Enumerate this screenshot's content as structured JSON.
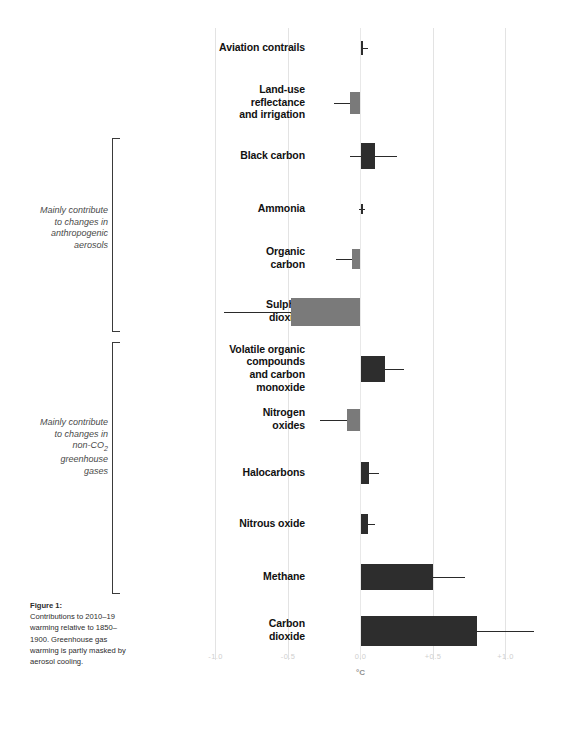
{
  "figure": {
    "caption_title": "Figure 1:",
    "caption_body": "Contributions to 2010–19 warming relative to 1850–1900. Greenhouse gas warming is partly masked by aerosol cooling."
  },
  "axis": {
    "unit_label": "°C",
    "tick_labels": [
      "-1.0",
      "-0.5",
      "0.0",
      "+0.5",
      "+1.0"
    ],
    "tick_values": [
      -1.0,
      -0.5,
      0.0,
      0.5,
      1.0
    ],
    "xmin": -1.15,
    "xmax": 1.45
  },
  "groups": [
    {
      "id": "anthropogenic-aerosols",
      "label_lines": [
        "Mainly contribute",
        "to changes in",
        "anthropogenic",
        "aerosols"
      ],
      "members": [
        "Black carbon",
        "Ammonia",
        "Organic carbon",
        "Sulphur dioxide"
      ]
    },
    {
      "id": "non-co2-greenhouse-gases",
      "label_lines": [
        "Mainly contribute",
        "to changes in",
        "non-CO2",
        "greenhouse",
        "gases"
      ],
      "members": [
        "Volatile organic compounds and carbon monoxide",
        "Nitrogen oxides",
        "Halocarbons",
        "Nitrous oxide",
        "Methane"
      ]
    }
  ],
  "colors": {
    "warming_bar": "#2d2d2d",
    "cooling_bar": "#7a7a7a",
    "gridline": "#e3e3e3",
    "tick_text": "#cfcfcf",
    "label_text": "#111111",
    "bracket_text": "#4a4a4a"
  },
  "chart_data": {
    "type": "bar",
    "orientation": "horizontal",
    "title": "",
    "subtitle": "",
    "xlabel": "°C",
    "ylabel": "",
    "xlim": [
      -1.15,
      1.45
    ],
    "grid": true,
    "legend": "none",
    "categories": [
      "Aviation contrails",
      "Land-use reflectance and irrigation",
      "Black carbon",
      "Ammonia",
      "Organic carbon",
      "Sulphur dioxide",
      "Volatile organic compounds and carbon monoxide",
      "Nitrogen oxides",
      "Halocarbons",
      "Nitrous oxide",
      "Methane",
      "Carbon dioxide"
    ],
    "values": [
      0.02,
      -0.07,
      0.1,
      0.01,
      -0.06,
      -0.48,
      0.17,
      -0.09,
      0.06,
      0.05,
      0.5,
      0.8
    ],
    "error_low": [
      0.0,
      -0.18,
      -0.07,
      -0.01,
      -0.17,
      -0.94,
      0.02,
      -0.28,
      0.02,
      0.02,
      0.02,
      0.02
    ],
    "error_high": [
      0.05,
      0.0,
      0.25,
      0.03,
      0.0,
      -0.02,
      0.3,
      0.0,
      0.13,
      0.1,
      0.72,
      1.2
    ]
  },
  "rows": [
    {
      "name": "aviation-contrails",
      "label_lines": [
        "Aviation contrails"
      ],
      "value": 0.02,
      "lo": 0.0,
      "hi": 0.05,
      "sign": "warming"
    },
    {
      "name": "land-use-reflectance-and-irrigation",
      "label_lines": [
        "Land-use",
        "reflectance",
        "and irrigation"
      ],
      "value": -0.07,
      "lo": -0.18,
      "hi": 0.0,
      "sign": "cooling"
    },
    {
      "name": "black-carbon",
      "label_lines": [
        "Black carbon"
      ],
      "value": 0.1,
      "lo": -0.07,
      "hi": 0.25,
      "sign": "warming"
    },
    {
      "name": "ammonia",
      "label_lines": [
        "Ammonia"
      ],
      "value": 0.01,
      "lo": -0.01,
      "hi": 0.03,
      "sign": "warming"
    },
    {
      "name": "organic-carbon",
      "label_lines": [
        "Organic",
        "carbon"
      ],
      "value": -0.06,
      "lo": -0.17,
      "hi": 0.0,
      "sign": "cooling"
    },
    {
      "name": "sulphur-dioxide",
      "label_lines": [
        "Sulphur",
        "dioxide"
      ],
      "value": -0.48,
      "lo": -0.94,
      "hi": -0.02,
      "sign": "cooling"
    },
    {
      "name": "volatile-organic-compounds-and-carbon-monoxide",
      "label_lines": [
        "Volatile organic",
        "compounds",
        "and carbon",
        "monoxide"
      ],
      "value": 0.17,
      "lo": 0.02,
      "hi": 0.3,
      "sign": "warming"
    },
    {
      "name": "nitrogen-oxides",
      "label_lines": [
        "Nitrogen",
        "oxides"
      ],
      "value": -0.09,
      "lo": -0.28,
      "hi": 0.0,
      "sign": "cooling"
    },
    {
      "name": "halocarbons",
      "label_lines": [
        "Halocarbons"
      ],
      "value": 0.06,
      "lo": 0.02,
      "hi": 0.13,
      "sign": "warming"
    },
    {
      "name": "nitrous-oxide",
      "label_lines": [
        "Nitrous oxide"
      ],
      "value": 0.05,
      "lo": 0.02,
      "hi": 0.1,
      "sign": "warming"
    },
    {
      "name": "methane",
      "label_lines": [
        "Methane"
      ],
      "value": 0.5,
      "lo": 0.02,
      "hi": 0.72,
      "sign": "warming"
    },
    {
      "name": "carbon-dioxide",
      "label_lines": [
        "Carbon",
        "dioxide"
      ],
      "value": 0.8,
      "lo": 0.02,
      "hi": 1.2,
      "sign": "warming"
    }
  ]
}
